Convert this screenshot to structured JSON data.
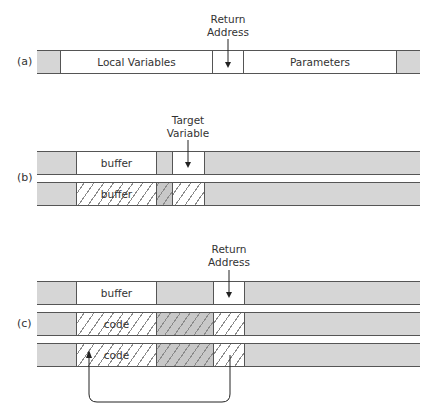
{
  "labels": {
    "a": "(a)",
    "b": "(b)",
    "c": "(c)"
  },
  "row_a": {
    "header_line1": "Return",
    "header_line2": "Address",
    "segments": {
      "local": "Local Variables",
      "params": "Parameters"
    }
  },
  "row_b": {
    "header_line1": "Target",
    "header_line2": "Variable",
    "bar1": {
      "buffer": "buffer"
    },
    "bar2": {
      "buffer": "buffer"
    }
  },
  "row_c": {
    "header_line1": "Return",
    "header_line2": "Address",
    "bar1": {
      "buffer": "buffer"
    },
    "bar2": {
      "code": "code"
    },
    "bar3": {
      "code": "code"
    }
  },
  "colors": {
    "gray": "#d6d6d6",
    "line": "#555555",
    "white": "#ffffff"
  }
}
